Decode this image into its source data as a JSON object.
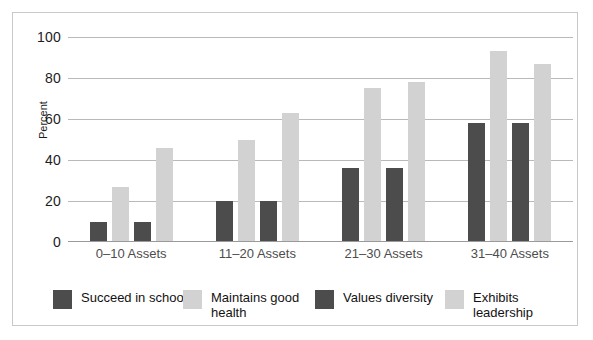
{
  "chart_data": {
    "type": "bar",
    "title": "",
    "xlabel": "",
    "ylabel": "Percent",
    "ylim": [
      0,
      100
    ],
    "yticks": [
      0,
      20,
      40,
      60,
      80,
      100
    ],
    "grid": true,
    "legend_position": "bottom",
    "categories": [
      "0–10 Assets",
      "11–20 Assets",
      "21–30 Assets",
      "31–40 Assets"
    ],
    "series": [
      {
        "name": "Succeed in school",
        "color": "#4c4c4c",
        "values": [
          10,
          20,
          36,
          58
        ]
      },
      {
        "name": "Maintains good health",
        "color": "#d2d2d2",
        "values": [
          27,
          50,
          75,
          93
        ]
      },
      {
        "name": "Values diversity",
        "color": "#4c4c4c",
        "values": [
          10,
          20,
          36,
          58
        ]
      },
      {
        "name": "Exhibits leadership",
        "color": "#d2d2d2",
        "values": [
          46,
          63,
          78,
          87
        ]
      }
    ]
  },
  "colors": {
    "dark_series": "#4c4c4c",
    "light_series": "#d2d2d2",
    "gridline": "#b9b9b9",
    "border": "#c9c9c9",
    "tick_text": "#1c1c1c",
    "category_text": "#4d4d4d"
  }
}
